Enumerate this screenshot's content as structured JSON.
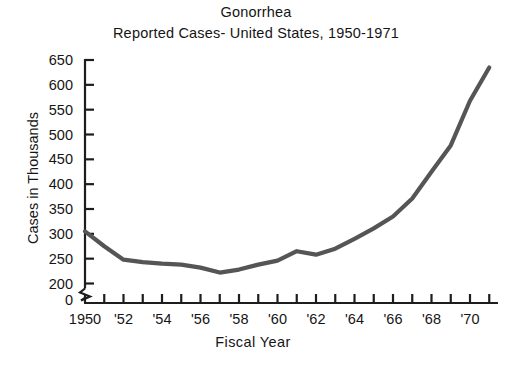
{
  "chart_data": {
    "type": "line",
    "title": "Gonorrhea",
    "subtitle": "Reported Cases- United States, 1950-1971",
    "xlabel": "Fiscal Year",
    "ylabel": "Cases in Thousands",
    "xlim": [
      1950,
      1971
    ],
    "ylim": [
      200,
      650
    ],
    "yaxis_break": true,
    "yaxis_break_between": [
      0,
      200
    ],
    "grid": false,
    "legend": null,
    "line_color": "#555555",
    "x_tick_interval_years": 1,
    "x_label_interval_years": 2,
    "ytick_labels": [
      "0",
      "200",
      "250",
      "300",
      "350",
      "400",
      "450",
      "500",
      "550",
      "600",
      "650"
    ],
    "ytick_values": [
      0,
      200,
      250,
      300,
      350,
      400,
      450,
      500,
      550,
      600,
      650
    ],
    "xtick_labels": [
      "1950",
      "'52",
      "'54",
      "'56",
      "'58",
      "'60",
      "'62",
      "'64",
      "'66",
      "'68",
      "'70"
    ],
    "xtick_label_values": [
      1950,
      1952,
      1954,
      1956,
      1958,
      1960,
      1962,
      1964,
      1966,
      1968,
      1970
    ],
    "x": [
      1950,
      1951,
      1952,
      1953,
      1954,
      1955,
      1956,
      1957,
      1958,
      1959,
      1960,
      1961,
      1962,
      1963,
      1964,
      1965,
      1966,
      1967,
      1968,
      1969,
      1970,
      1971
    ],
    "values": [
      305,
      275,
      248,
      243,
      240,
      238,
      232,
      222,
      228,
      238,
      246,
      265,
      258,
      270,
      290,
      311,
      335,
      371,
      425,
      478,
      568,
      635
    ],
    "series": [
      {
        "name": "Reported cases",
        "values": [
          305,
          275,
          248,
          243,
          240,
          238,
          232,
          222,
          228,
          238,
          246,
          265,
          258,
          270,
          290,
          311,
          335,
          371,
          425,
          478,
          568,
          635
        ]
      }
    ]
  }
}
